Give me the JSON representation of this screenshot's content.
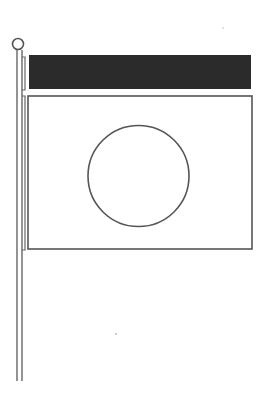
{
  "image": {
    "subject": "flag-on-pole-line-drawing",
    "colors": {
      "background": "#ffffff",
      "line": "#555555",
      "band": "#2b2b2b"
    }
  },
  "flag": {
    "top_band": "dark",
    "body": "white",
    "emblem": "circle"
  }
}
